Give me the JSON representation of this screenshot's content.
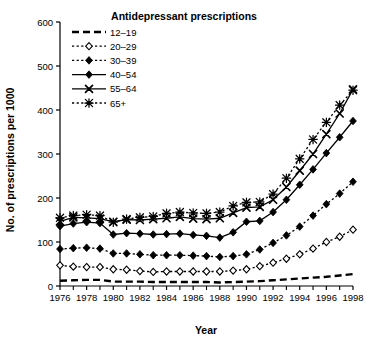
{
  "chart_data": {
    "type": "line",
    "title": "Antidepressant prescriptions",
    "xlabel": "Year",
    "ylabel": "No. of prescriptions per 1000",
    "xlim": [
      1976,
      1998
    ],
    "ylim": [
      0,
      600
    ],
    "ytick_values": [
      0,
      100,
      200,
      300,
      400,
      500,
      600
    ],
    "ytick_labels": [
      "0",
      "100",
      "200",
      "300",
      "400",
      "500",
      "600"
    ],
    "xtick_labels": [
      "1976",
      "1978",
      "1980",
      "1982",
      "1984",
      "1986",
      "1988",
      "1990",
      "1992",
      "1994",
      "1996",
      "1998"
    ],
    "xtick_values": [
      1976,
      1978,
      1980,
      1982,
      1984,
      1986,
      1988,
      1990,
      1992,
      1994,
      1996,
      1998
    ],
    "x_minor_ticks": [
      1977,
      1979,
      1981,
      1983,
      1985,
      1987,
      1989,
      1991,
      1993,
      1995,
      1997
    ],
    "grid": false,
    "legend_position": "top-left",
    "x": [
      1976,
      1977,
      1978,
      1979,
      1980,
      1981,
      1982,
      1983,
      1984,
      1985,
      1986,
      1987,
      1988,
      1989,
      1990,
      1991,
      1992,
      1993,
      1994,
      1995,
      1996,
      1997,
      1998
    ],
    "series": [
      {
        "name": "12–19",
        "label": "12–19",
        "marker": "none",
        "line": "dashed",
        "color": "#000000",
        "values": [
          12,
          13,
          14,
          14,
          10,
          10,
          10,
          9,
          9,
          9,
          9,
          9,
          8,
          9,
          10,
          11,
          13,
          15,
          17,
          19,
          21,
          24,
          27
        ]
      },
      {
        "name": "20–29",
        "label": "20–29",
        "marker": "open-diamond",
        "line": "dotted",
        "color": "#000000",
        "values": [
          47,
          44,
          43,
          43,
          38,
          37,
          34,
          32,
          33,
          33,
          33,
          33,
          33,
          35,
          38,
          45,
          53,
          62,
          72,
          85,
          100,
          112,
          128
        ]
      },
      {
        "name": "30–39",
        "label": "30–39",
        "marker": "filled-diamond",
        "line": "dotted",
        "color": "#000000",
        "values": [
          84,
          86,
          87,
          85,
          74,
          74,
          72,
          70,
          70,
          70,
          69,
          68,
          66,
          68,
          72,
          83,
          98,
          115,
          135,
          160,
          186,
          210,
          237
        ]
      },
      {
        "name": "40–54",
        "label": "40–54",
        "marker": "filled-diamond",
        "line": "solid",
        "color": "#000000",
        "values": [
          136,
          142,
          145,
          143,
          117,
          120,
          119,
          117,
          118,
          119,
          116,
          114,
          110,
          122,
          146,
          148,
          168,
          196,
          230,
          265,
          302,
          338,
          375
        ]
      },
      {
        "name": "55–64",
        "label": "55–64",
        "marker": "cross",
        "line": "solid",
        "color": "#000000",
        "values": [
          147,
          156,
          155,
          153,
          146,
          151,
          150,
          152,
          154,
          157,
          153,
          152,
          154,
          166,
          178,
          180,
          196,
          225,
          262,
          300,
          345,
          392,
          447
        ]
      },
      {
        "name": "65+",
        "label": "65+",
        "marker": "star",
        "line": "dotted",
        "color": "#000000",
        "values": [
          155,
          160,
          162,
          160,
          145,
          152,
          156,
          158,
          165,
          168,
          166,
          165,
          168,
          182,
          190,
          191,
          209,
          245,
          289,
          333,
          372,
          411,
          445
        ]
      }
    ]
  }
}
